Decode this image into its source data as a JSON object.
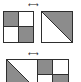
{
  "diagram": {
    "title": "",
    "colors": {
      "fill": "#8c8c8c",
      "stroke": "#2e2e2e",
      "background": "#ffffff"
    },
    "top_row": {
      "arrow_icon": "swap-arrows-icon",
      "arrow_glyph": "←→",
      "left_shape": {
        "type": "2x2-checker",
        "filled_cells": [
          "top-left",
          "bottom-right"
        ]
      },
      "right_shape": {
        "type": "diagonal-split-square",
        "filled_region": "upper-right-triangle"
      }
    },
    "bottom_row": {
      "arrow_icon": "swap-arrows-icon",
      "arrow_glyph": "←→",
      "left_shape": {
        "type": "diagonal-split-square",
        "filled_region": "lower-left-triangle"
      },
      "right_shape": {
        "type": "2x2-checker",
        "filled_cells": [
          "top-left",
          "bottom-right"
        ]
      }
    }
  }
}
